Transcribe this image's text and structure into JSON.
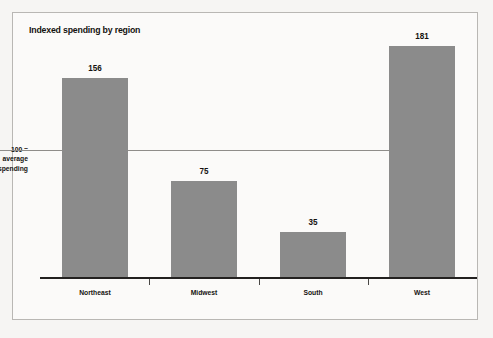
{
  "chart_data": {
    "type": "bar",
    "title": "Indexed spending by region",
    "categories": [
      "Northeast",
      "Midwest",
      "South",
      "West"
    ],
    "values": [
      156,
      75,
      35,
      181
    ],
    "xlabel": "",
    "ylabel": "",
    "ylim": [
      0,
      200
    ],
    "grid": false,
    "legend": null,
    "annotations": [
      {
        "type": "reference-line",
        "value": 100,
        "label_lines": [
          "100 =",
          "average",
          "spending"
        ],
        "label": "100 = average spending"
      }
    ],
    "data_labels": [
      "156",
      "75",
      "35",
      "181"
    ],
    "series": [
      {
        "name": "Indexed spending",
        "values": [
          156,
          75,
          35,
          181
        ]
      }
    ]
  },
  "style": {
    "bar_color": "#8b8b8b",
    "axis_color": "#232120",
    "reference_line_color": "#8f8d8a",
    "frame_color": "#b9b7b4",
    "background": "#f6f5f3",
    "plot_background": "#fbfaf9",
    "text_color": "#14120f"
  },
  "axis": {
    "reference_label_line1": "100 =",
    "reference_label_line2": "average",
    "reference_label_line3": "spending"
  },
  "bars": [
    {
      "label": "Northeast",
      "value_text": "156"
    },
    {
      "label": "Midwest",
      "value_text": "75"
    },
    {
      "label": "South",
      "value_text": "35"
    },
    {
      "label": "West",
      "value_text": "181"
    }
  ]
}
